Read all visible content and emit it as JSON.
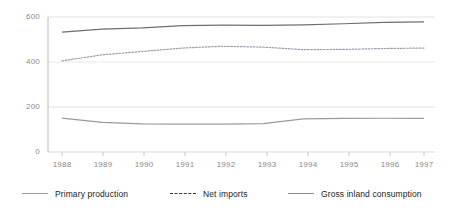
{
  "chart_data": {
    "type": "line",
    "title": "",
    "xlabel": "",
    "ylabel": "",
    "categories": [
      "1988",
      "1989",
      "1990",
      "1991",
      "1992",
      "1993",
      "1994",
      "1995",
      "1996",
      "1997"
    ],
    "x": [
      1988,
      1989,
      1990,
      1991,
      1992,
      1993,
      1994,
      1995,
      1996,
      1997
    ],
    "ylim": [
      0,
      600
    ],
    "yticks": [
      0,
      200,
      400,
      600
    ],
    "grid": true,
    "legend_position": "bottom",
    "series": [
      {
        "name": "Primary production",
        "style": "solid",
        "color": "#9a9a9a",
        "values": [
          151,
          132,
          125,
          124,
          124,
          126,
          147,
          149,
          150,
          150
        ]
      },
      {
        "name": "Net imports",
        "style": "dashed",
        "color": "#9d9db5",
        "values": [
          405,
          432,
          447,
          462,
          470,
          466,
          455,
          456,
          460,
          462
        ]
      },
      {
        "name": "Gross inland consumption",
        "style": "solid",
        "color": "#6e6e6e",
        "values": [
          533,
          546,
          552,
          562,
          564,
          563,
          565,
          570,
          576,
          578
        ]
      }
    ]
  },
  "axes": {
    "y_tick_labels": [
      "600",
      "400",
      "200",
      "0"
    ],
    "x_tick_labels": [
      "1988",
      "1989",
      "1990",
      "1991",
      "1992",
      "1993",
      "1994",
      "1995",
      "1996",
      "1997"
    ]
  },
  "legend": {
    "items": [
      {
        "label": "Primary production",
        "icon": "solid-line-swatch-icon"
      },
      {
        "label": "Net imports",
        "icon": "dashed-line-swatch-icon"
      },
      {
        "label": "Gross inland consumption",
        "icon": "solid-line-swatch-icon"
      }
    ]
  },
  "colors": {
    "grid": "#e2e2e2",
    "axis": "#cfcfcf",
    "tick_text": "#8a8a8a",
    "legend_text": "#1b1b1b",
    "primary_production": "#9a9a9a",
    "net_imports": "#9d9db5",
    "gross_inland_consumption": "#6e6e6e",
    "background": "#ffffff"
  }
}
